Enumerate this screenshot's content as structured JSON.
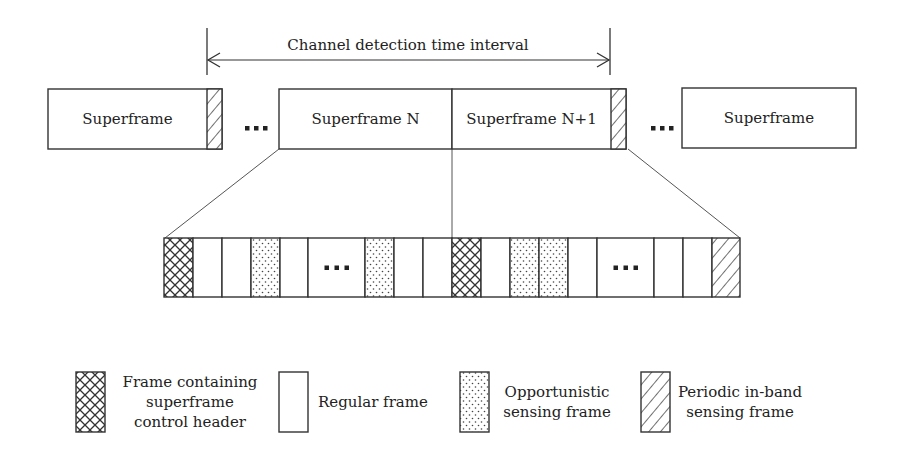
{
  "title": {
    "interval_label": "Channel detection time interval",
    "arrow_left_x": 207,
    "arrow_right_x": 610
  },
  "colors": {
    "stroke": "#333333",
    "text": "#222222",
    "background": "#ffffff"
  },
  "superframes": [
    {
      "label": "Superframe",
      "x": 48,
      "y": 89,
      "w": 174,
      "h": 60,
      "tail": "periodic-in-band-sensing"
    },
    {
      "label": "Superframe N",
      "x": 279,
      "y": 89,
      "w": 173,
      "h": 60,
      "tail": null
    },
    {
      "label": "Superframe N+1",
      "x": 452,
      "y": 89,
      "w": 174,
      "h": 60,
      "tail": "periodic-in-band-sensing"
    },
    {
      "label": "Superframe",
      "x": 682,
      "y": 88,
      "w": 174,
      "h": 60,
      "tail": null
    }
  ],
  "superframe_ellipses": [
    {
      "x": 247,
      "y": 128,
      "text": "..."
    },
    {
      "x": 653,
      "y": 128,
      "text": "..."
    }
  ],
  "frame_row": {
    "y": 238,
    "h": 59,
    "frames": [
      {
        "x": 164,
        "w": 29,
        "type": "control-header"
      },
      {
        "x": 193,
        "w": 29,
        "type": "regular"
      },
      {
        "x": 222,
        "w": 29,
        "type": "regular"
      },
      {
        "x": 251,
        "w": 29,
        "type": "opportunistic-sensing"
      },
      {
        "x": 280,
        "w": 28,
        "type": "regular"
      },
      {
        "x": 308,
        "w": 57,
        "type": "ellipsis"
      },
      {
        "x": 365,
        "w": 29,
        "type": "opportunistic-sensing"
      },
      {
        "x": 394,
        "w": 29,
        "type": "regular"
      },
      {
        "x": 423,
        "w": 29,
        "type": "regular"
      },
      {
        "x": 452,
        "w": 29,
        "type": "control-header"
      },
      {
        "x": 481,
        "w": 29,
        "type": "regular"
      },
      {
        "x": 510,
        "w": 29,
        "type": "opportunistic-sensing"
      },
      {
        "x": 539,
        "w": 29,
        "type": "opportunistic-sensing"
      },
      {
        "x": 568,
        "w": 29,
        "type": "regular"
      },
      {
        "x": 597,
        "w": 57,
        "type": "ellipsis"
      },
      {
        "x": 654,
        "w": 29,
        "type": "regular"
      },
      {
        "x": 683,
        "w": 29,
        "type": "regular"
      },
      {
        "x": 712,
        "w": 28,
        "type": "periodic-in-band-sensing"
      }
    ]
  },
  "connectors": [
    {
      "x1": 279,
      "y1": 149,
      "x2": 165,
      "y2": 238
    },
    {
      "x1": 452,
      "y1": 149,
      "x2": 452,
      "y2": 238
    },
    {
      "x1": 628,
      "y1": 149,
      "x2": 740,
      "y2": 238
    }
  ],
  "legend": [
    {
      "type": "control-header",
      "box_x": 76,
      "lines": [
        "Frame containing",
        "superframe",
        "control header"
      ],
      "text_x": 190,
      "anchor": "middle"
    },
    {
      "type": "regular",
      "box_x": 279,
      "lines": [
        "Regular frame"
      ],
      "text_x": 318,
      "anchor": "start"
    },
    {
      "type": "opportunistic-sensing",
      "box_x": 460,
      "lines": [
        "Opportunistic",
        "sensing frame"
      ],
      "text_x": 557,
      "anchor": "middle"
    },
    {
      "type": "periodic-in-band-sensing",
      "box_x": 641,
      "lines": [
        "Periodic in-band",
        "sensing frame"
      ],
      "text_x": 740,
      "anchor": "middle"
    }
  ],
  "legend_box": {
    "y": 372,
    "w": 29,
    "h": 60
  }
}
